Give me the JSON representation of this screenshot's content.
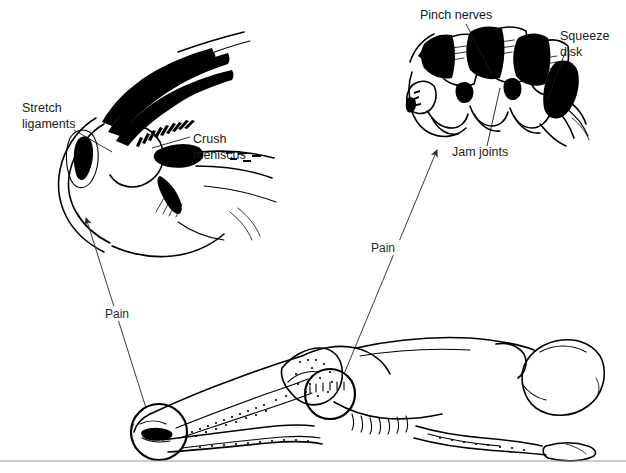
{
  "figure": {
    "background_color": "#ffffff",
    "ink_color": "#000000",
    "leader_color": "#1a1a1a"
  },
  "knee_detail": {
    "name": "knee-joint-detail",
    "labels": [
      {
        "id": "stretch-ligaments",
        "line1": "Stretch",
        "line2": "ligaments",
        "x": 22,
        "y": 112,
        "anchor": "start"
      },
      {
        "id": "crush-meniscus",
        "line1": "Crush",
        "line2": "meniscus",
        "x": 193,
        "y": 143,
        "anchor": "start"
      }
    ]
  },
  "spine_detail": {
    "name": "lumbar-vertebrae-detail",
    "labels": [
      {
        "id": "pinch-nerves",
        "line1": "Pinch nerves",
        "line2": "",
        "x": 420,
        "y": 19,
        "anchor": "start"
      },
      {
        "id": "squeeze-disk",
        "line1": "Squeeze",
        "line2": "disk",
        "x": 560,
        "y": 40,
        "anchor": "start"
      },
      {
        "id": "jam-joints",
        "line1": "Jam joints",
        "line2": "",
        "x": 452,
        "y": 156,
        "anchor": "start"
      }
    ]
  },
  "body_figure": {
    "name": "reclining-person-side-lying",
    "description": "Person lying on side with hips and knees flexed, head at right",
    "highlight_circles": [
      {
        "id": "knee-highlight",
        "cx": 159,
        "cy": 432,
        "r": 28
      },
      {
        "id": "lumbar-highlight",
        "cx": 330,
        "cy": 394,
        "r": 25
      }
    ]
  },
  "pain_arrows": [
    {
      "id": "pain-arrow-knee",
      "label": "Pain",
      "label_x": 105,
      "label_y": 318,
      "from_x": 146,
      "from_y": 408,
      "to_x": 86,
      "to_y": 215
    },
    {
      "id": "pain-arrow-spine",
      "label": "Pain",
      "label_x": 371,
      "label_y": 252,
      "from_x": 344,
      "from_y": 374,
      "to_x": 438,
      "to_y": 148
    }
  ],
  "footer_rule": {
    "id": "bottom-divider",
    "y": 461,
    "color": "#9a9a9a"
  }
}
